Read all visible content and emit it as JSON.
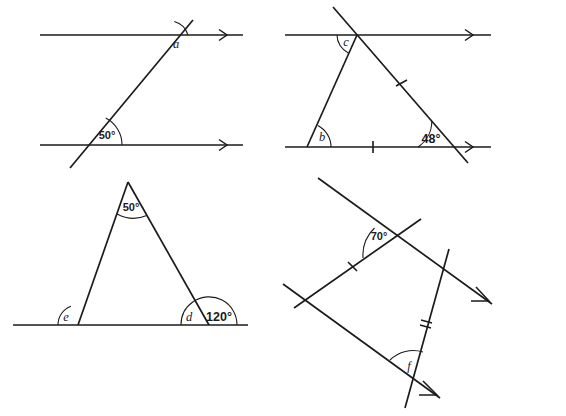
{
  "page": {
    "background_color": "#ffffff",
    "ink_color": "#1b1b1b"
  },
  "figures": [
    {
      "id": "fig-a",
      "name": "parallel-lines-transversal",
      "description": "Two parallel horizontal lines with arrowheads cut by a transversal",
      "labels": {
        "angle_a": "a",
        "angle_50": "50°"
      },
      "arrow_count": 1
    },
    {
      "id": "fig-b",
      "name": "triangle-between-parallel-lines",
      "description": "Triangle formed between two parallel horizontal lines with a transversal",
      "labels": {
        "angle_c": "c",
        "angle_b": "b",
        "angle_48": "48°"
      },
      "tick_marks": 2,
      "arrow_count": 2
    },
    {
      "id": "fig-c",
      "name": "isosceles-triangle-on-baseline",
      "description": "Triangle sitting on a horizontal base line with exterior angle marked",
      "labels": {
        "angle_apex_50": "50°",
        "angle_e": "e",
        "angle_d": "d",
        "angle_120": "120°"
      }
    },
    {
      "id": "fig-d",
      "name": "parallelogram-two-transversals",
      "description": "Two parallel lines with arrowheads crossed by two transversal lines forming a parallelogram",
      "labels": {
        "angle_70": "70°",
        "angle_f": "f"
      },
      "tick_marks_single": 1,
      "tick_marks_double": 1,
      "arrow_count": 2
    }
  ]
}
